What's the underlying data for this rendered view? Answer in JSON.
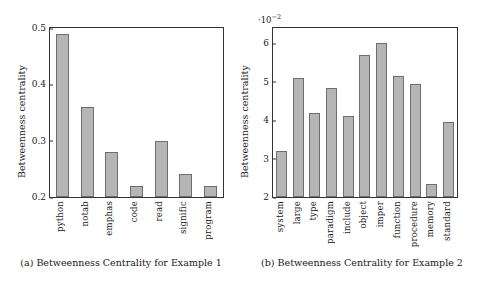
{
  "figure": {
    "panels": [
      {
        "id": "a",
        "caption": "(a) Betweenness Centrality for Example 1",
        "ylabel": "Betweenness centrality",
        "multiplier": ""
      },
      {
        "id": "b",
        "caption": "(b) Betweenness Centrality for Example 2",
        "ylabel": "Betweenness centrality",
        "multiplier": "·10",
        "multiplier_exp": "−2"
      }
    ]
  },
  "chart_data": [
    {
      "type": "bar",
      "title": "(a) Betweenness Centrality for Example 1",
      "xlabel": "",
      "ylabel": "Betweenness centrality",
      "categories": [
        "python",
        "notab",
        "emphas",
        "code",
        "read",
        "signific",
        "program"
      ],
      "values": [
        0.49,
        0.36,
        0.28,
        0.22,
        0.3,
        0.24,
        0.22
      ],
      "ylim": [
        0.2,
        0.5
      ],
      "yticks": [
        "0.2",
        "0.3",
        "0.4",
        "0.5"
      ],
      "ytick_values": [
        0.2,
        0.3,
        0.4,
        0.5
      ],
      "grid": false,
      "legend": "none",
      "bar_color": "#b5b5b5",
      "bar_edge_color": "#6e6e6e"
    },
    {
      "type": "bar",
      "title": "(b) Betweenness Centrality for Example 2",
      "xlabel": "",
      "ylabel": "Betweenness centrality",
      "y_multiplier": 0.01,
      "y_multiplier_label": "·10⁻²",
      "categories": [
        "system",
        "large",
        "type",
        "paradigm",
        "include",
        "object",
        "imper",
        "function",
        "procedure",
        "memory",
        "standard"
      ],
      "values": [
        3.2,
        5.1,
        4.2,
        4.85,
        4.1,
        5.7,
        6.0,
        5.15,
        4.95,
        2.35,
        3.95
      ],
      "ylim": [
        2,
        6.4
      ],
      "yticks": [
        "2",
        "3",
        "4",
        "5",
        "6"
      ],
      "ytick_values": [
        2,
        3,
        4,
        5,
        6
      ],
      "grid": false,
      "legend": "none",
      "bar_color": "#b5b5b5",
      "bar_edge_color": "#6e6e6e"
    }
  ]
}
